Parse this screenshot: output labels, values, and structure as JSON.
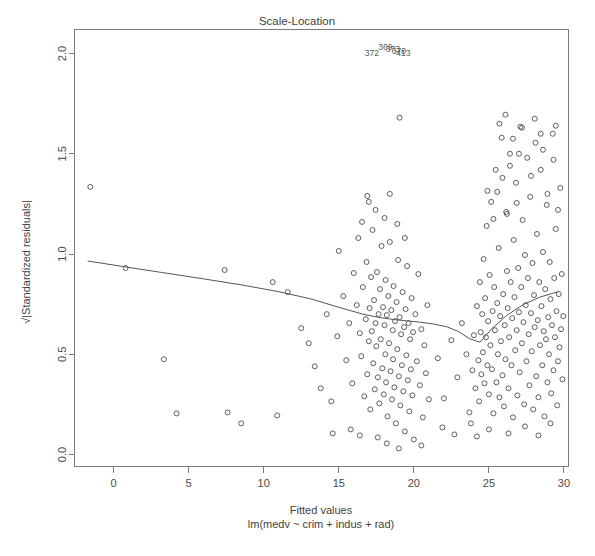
{
  "chart_data": {
    "type": "scatter",
    "title": "Scale-Location",
    "xlabel": "Fitted values",
    "sublabel": "lm(medv ~ crim + indus + rad)",
    "ylabel": "√|Standardized residuals|",
    "grid": false,
    "legend": null,
    "xlim": [
      -2.6,
      30.3
    ],
    "ylim": [
      -0.06,
      2.12
    ],
    "xticks": [
      0,
      5,
      10,
      15,
      20,
      25,
      30
    ],
    "xtick_labels": [
      "0",
      "5",
      "10",
      "15",
      "20",
      "25",
      "30"
    ],
    "yticks": [
      0.0,
      0.5,
      1.0,
      1.5,
      2.0
    ],
    "ytick_labels": [
      "0.0",
      "0.5",
      "1.0",
      "1.5",
      "2.0"
    ],
    "marker": "open-circle",
    "marker_size": 5,
    "point_labels": [
      {
        "text": "372",
        "x": 17.2,
        "y": 1.99
      },
      {
        "text": "369",
        "x": 18.1,
        "y": 2.02
      },
      {
        "text": "373",
        "x": 18.6,
        "y": 2.01
      },
      {
        "text": "370",
        "x": 19.0,
        "y": 2.0
      },
      {
        "text": "413",
        "x": 19.3,
        "y": 1.99
      }
    ],
    "smooth_line": {
      "name": "lowess",
      "x": [
        -1.7,
        0.6,
        3.2,
        6.0,
        8.6,
        11.0,
        13.2,
        15.1,
        16.6,
        17.8,
        18.8,
        19.6,
        20.4,
        21.3,
        22.2,
        23.0,
        23.7,
        24.4,
        25.2,
        26.2,
        27.3,
        28.4,
        29.6
      ],
      "y": [
        0.965,
        0.938,
        0.908,
        0.876,
        0.845,
        0.812,
        0.775,
        0.732,
        0.7,
        0.682,
        0.672,
        0.666,
        0.66,
        0.651,
        0.637,
        0.612,
        0.578,
        0.56,
        0.628,
        0.695,
        0.748,
        0.785,
        0.812
      ]
    },
    "points": [
      [
        -1.55,
        1.335
      ],
      [
        0.8,
        0.93
      ],
      [
        3.35,
        0.475
      ],
      [
        4.2,
        0.205
      ],
      [
        7.4,
        0.92
      ],
      [
        7.6,
        0.21
      ],
      [
        8.5,
        0.155
      ],
      [
        10.6,
        0.86
      ],
      [
        10.9,
        0.195
      ],
      [
        11.6,
        0.81
      ],
      [
        12.5,
        0.63
      ],
      [
        13.0,
        0.555
      ],
      [
        13.4,
        0.44
      ],
      [
        13.8,
        0.33
      ],
      [
        14.2,
        0.7
      ],
      [
        14.5,
        0.265
      ],
      [
        14.9,
        0.59
      ],
      [
        15.0,
        1.015
      ],
      [
        15.3,
        0.79
      ],
      [
        15.5,
        0.47
      ],
      [
        15.7,
        0.655
      ],
      [
        15.9,
        0.355
      ],
      [
        16.0,
        0.905
      ],
      [
        16.2,
        0.745
      ],
      [
        16.3,
        1.08
      ],
      [
        16.4,
        0.605
      ],
      [
        16.5,
        0.49
      ],
      [
        16.6,
        0.835
      ],
      [
        16.7,
        0.29
      ],
      [
        16.8,
        0.675
      ],
      [
        16.85,
        0.96
      ],
      [
        16.9,
        0.4
      ],
      [
        17.0,
        0.565
      ],
      [
        17.05,
        0.73
      ],
      [
        17.1,
        0.225
      ],
      [
        17.15,
        0.885
      ],
      [
        17.2,
        0.615
      ],
      [
        17.25,
        1.12
      ],
      [
        17.3,
        0.455
      ],
      [
        17.35,
        0.77
      ],
      [
        17.4,
        0.325
      ],
      [
        17.45,
        0.655
      ],
      [
        17.5,
        0.54
      ],
      [
        17.55,
        0.91
      ],
      [
        17.6,
        0.385
      ],
      [
        17.65,
        0.7
      ],
      [
        17.7,
        0.255
      ],
      [
        17.75,
        0.825
      ],
      [
        17.8,
        0.575
      ],
      [
        17.85,
        1.04
      ],
      [
        17.9,
        0.43
      ],
      [
        17.95,
        0.735
      ],
      [
        18.0,
        0.3
      ],
      [
        18.05,
        0.645
      ],
      [
        18.1,
        0.5
      ],
      [
        18.12,
        0.87
      ],
      [
        18.15,
        0.36
      ],
      [
        18.2,
        0.695
      ],
      [
        18.25,
        0.19
      ],
      [
        18.3,
        0.79
      ],
      [
        18.35,
        0.555
      ],
      [
        18.4,
        1.06
      ],
      [
        18.45,
        0.415
      ],
      [
        18.5,
        0.72
      ],
      [
        18.55,
        0.275
      ],
      [
        18.6,
        0.62
      ],
      [
        18.62,
        0.475
      ],
      [
        18.65,
        0.84
      ],
      [
        18.7,
        0.335
      ],
      [
        18.75,
        0.665
      ],
      [
        18.8,
        0.155
      ],
      [
        18.85,
        0.76
      ],
      [
        18.9,
        0.525
      ],
      [
        18.95,
        0.97
      ],
      [
        19.0,
        0.39
      ],
      [
        19.05,
        0.685
      ],
      [
        19.1,
        0.245
      ],
      [
        19.15,
        0.6
      ],
      [
        19.2,
        0.445
      ],
      [
        19.25,
        0.81
      ],
      [
        19.3,
        0.315
      ],
      [
        19.35,
        0.635
      ],
      [
        19.4,
        0.115
      ],
      [
        19.45,
        0.725
      ],
      [
        19.5,
        0.495
      ],
      [
        19.55,
        0.94
      ],
      [
        19.6,
        0.37
      ],
      [
        19.65,
        0.655
      ],
      [
        19.7,
        0.215
      ],
      [
        19.75,
        0.575
      ],
      [
        19.8,
        0.425
      ],
      [
        19.85,
        0.78
      ],
      [
        19.9,
        0.295
      ],
      [
        19.95,
        0.61
      ],
      [
        20.0,
        0.075
      ],
      [
        20.1,
        0.7
      ],
      [
        20.2,
        0.465
      ],
      [
        20.3,
        0.9
      ],
      [
        20.4,
        0.345
      ],
      [
        20.5,
        0.625
      ],
      [
        20.6,
        0.185
      ],
      [
        20.7,
        0.545
      ],
      [
        20.8,
        0.405
      ],
      [
        20.9,
        0.745
      ],
      [
        21.0,
        0.275
      ],
      [
        19.05,
        1.68
      ],
      [
        16.9,
        1.29
      ],
      [
        17.45,
        1.22
      ],
      [
        18.05,
        1.18
      ],
      [
        18.9,
        1.15
      ],
      [
        19.4,
        1.08
      ],
      [
        16.55,
        1.16
      ],
      [
        17.0,
        1.26
      ],
      [
        18.4,
        1.3
      ],
      [
        21.6,
        0.48
      ],
      [
        22.0,
        0.28
      ],
      [
        22.5,
        0.57
      ],
      [
        22.9,
        0.385
      ],
      [
        23.2,
        0.655
      ],
      [
        23.5,
        0.5
      ],
      [
        23.7,
        0.21
      ],
      [
        23.9,
        0.42
      ],
      [
        24.0,
        0.595
      ],
      [
        24.1,
        0.33
      ],
      [
        24.2,
        0.74
      ],
      [
        24.3,
        0.47
      ],
      [
        24.35,
        0.265
      ],
      [
        24.4,
        0.86
      ],
      [
        24.45,
        0.61
      ],
      [
        24.5,
        0.4
      ],
      [
        24.55,
        0.7
      ],
      [
        24.6,
        0.51
      ],
      [
        24.65,
        0.975
      ],
      [
        24.7,
        0.355
      ],
      [
        24.75,
        0.78
      ],
      [
        24.8,
        0.585
      ],
      [
        24.85,
        1.14
      ],
      [
        24.9,
        0.445
      ],
      [
        24.95,
        0.665
      ],
      [
        25.0,
        0.3
      ],
      [
        25.05,
        0.895
      ],
      [
        25.1,
        0.545
      ],
      [
        25.15,
        1.26
      ],
      [
        25.2,
        0.425
      ],
      [
        25.25,
        0.715
      ],
      [
        25.3,
        0.205
      ],
      [
        25.35,
        0.835
      ],
      [
        25.4,
        0.62
      ],
      [
        25.45,
        1.42
      ],
      [
        25.5,
        0.36
      ],
      [
        25.55,
        0.755
      ],
      [
        25.6,
        0.5
      ],
      [
        25.65,
        1.03
      ],
      [
        25.7,
        0.285
      ],
      [
        25.75,
        0.69
      ],
      [
        25.8,
        0.565
      ],
      [
        25.85,
        1.58
      ],
      [
        25.9,
        0.395
      ],
      [
        25.95,
        0.8
      ],
      [
        26.0,
        0.24
      ],
      [
        26.05,
        0.645
      ],
      [
        26.1,
        0.475
      ],
      [
        26.15,
        1.21
      ],
      [
        26.2,
        0.915
      ],
      [
        26.25,
        0.73
      ],
      [
        26.3,
        0.33
      ],
      [
        26.35,
        0.585
      ],
      [
        26.4,
        1.5
      ],
      [
        26.45,
        0.86
      ],
      [
        26.5,
        0.445
      ],
      [
        26.55,
        0.68
      ],
      [
        26.6,
        0.185
      ],
      [
        26.65,
        1.07
      ],
      [
        26.7,
        0.785
      ],
      [
        26.75,
        0.52
      ],
      [
        26.8,
        1.355
      ],
      [
        26.85,
        0.62
      ],
      [
        26.9,
        0.295
      ],
      [
        26.95,
        0.93
      ],
      [
        27.0,
        0.71
      ],
      [
        27.05,
        0.41
      ],
      [
        27.1,
        1.635
      ],
      [
        27.15,
        0.835
      ],
      [
        27.2,
        0.555
      ],
      [
        27.25,
        1.17
      ],
      [
        27.3,
        0.66
      ],
      [
        27.35,
        0.25
      ],
      [
        27.4,
        0.995
      ],
      [
        27.45,
        0.745
      ],
      [
        27.5,
        0.465
      ],
      [
        27.55,
        1.48
      ],
      [
        27.6,
        0.88
      ],
      [
        27.65,
        0.6
      ],
      [
        27.7,
        0.345
      ],
      [
        27.75,
        1.285
      ],
      [
        27.8,
        0.705
      ],
      [
        27.85,
        0.515
      ],
      [
        27.9,
        0.955
      ],
      [
        27.95,
        0.225
      ],
      [
        28.0,
        0.795
      ],
      [
        28.05,
        0.635
      ],
      [
        28.1,
        1.555
      ],
      [
        28.15,
        0.39
      ],
      [
        28.2,
        1.1
      ],
      [
        28.25,
        0.67
      ],
      [
        28.3,
        0.285
      ],
      [
        28.35,
        0.86
      ],
      [
        28.4,
        0.545
      ],
      [
        28.45,
        1.42
      ],
      [
        28.5,
        0.74
      ],
      [
        28.55,
        0.445
      ],
      [
        28.6,
        1.01
      ],
      [
        28.65,
        0.615
      ],
      [
        28.7,
        0.19
      ],
      [
        28.75,
        0.825
      ],
      [
        28.8,
        0.575
      ],
      [
        28.85,
        1.245
      ],
      [
        28.9,
        0.36
      ],
      [
        28.95,
        0.685
      ],
      [
        29.0,
        0.5
      ],
      [
        29.05,
        0.96
      ],
      [
        29.1,
        0.775
      ],
      [
        29.15,
        0.305
      ],
      [
        29.2,
        0.645
      ],
      [
        29.25,
        1.6
      ],
      [
        29.3,
        0.42
      ],
      [
        29.35,
        0.88
      ],
      [
        29.4,
        0.585
      ],
      [
        29.45,
        1.125
      ],
      [
        29.5,
        0.715
      ],
      [
        29.55,
        0.245
      ],
      [
        29.6,
        0.465
      ],
      [
        29.65,
        0.8
      ],
      [
        29.7,
        0.535
      ],
      [
        29.75,
        1.33
      ],
      [
        29.8,
        0.625
      ],
      [
        29.85,
        0.9
      ],
      [
        29.9,
        0.375
      ],
      [
        29.95,
        0.69
      ],
      [
        24.2,
        0.09
      ],
      [
        25.0,
        0.125
      ],
      [
        23.8,
        0.155
      ],
      [
        26.3,
        0.105
      ],
      [
        27.4,
        0.14
      ],
      [
        28.3,
        0.095
      ],
      [
        29.1,
        0.155
      ],
      [
        22.7,
        0.1
      ],
      [
        21.9,
        0.135
      ],
      [
        18.2,
        0.055
      ],
      [
        19.0,
        0.03
      ],
      [
        17.6,
        0.085
      ],
      [
        20.5,
        0.045
      ],
      [
        16.4,
        0.095
      ],
      [
        15.8,
        0.125
      ],
      [
        14.6,
        0.105
      ],
      [
        26.1,
        1.695
      ],
      [
        26.6,
        1.575
      ],
      [
        25.7,
        1.65
      ],
      [
        27.0,
        1.5
      ],
      [
        25.9,
        1.38
      ],
      [
        26.4,
        1.44
      ],
      [
        25.55,
        1.31
      ],
      [
        26.85,
        1.255
      ],
      [
        24.9,
        1.315
      ],
      [
        25.3,
        1.175
      ],
      [
        26.2,
        1.2
      ],
      [
        27.8,
        1.39
      ],
      [
        28.6,
        1.52
      ],
      [
        29.3,
        1.47
      ],
      [
        28.9,
        1.3
      ],
      [
        29.6,
        1.22
      ],
      [
        27.2,
        1.63
      ],
      [
        28.05,
        1.675
      ],
      [
        29.45,
        1.64
      ],
      [
        28.45,
        1.6
      ]
    ]
  }
}
